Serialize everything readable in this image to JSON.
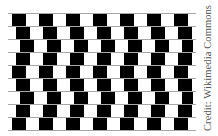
{
  "image": {
    "subject": "Café wall illusion",
    "colors": {
      "background": "#ffffff",
      "tile_dark": "#000000",
      "tile_light": "#ffffff",
      "mortar": "#a8a8a8",
      "credit_text": "#555555"
    },
    "grid": {
      "left": 9,
      "right": 193,
      "top": 13,
      "row_height": 13,
      "rows": 9,
      "tile_width": 13.5,
      "mortar_extent_right": 196,
      "row_offsets": [
        3,
        7,
        11,
        7,
        3,
        7,
        11,
        7,
        3
      ]
    }
  },
  "credit": {
    "text": "Credit: Wikimedia Commons"
  }
}
